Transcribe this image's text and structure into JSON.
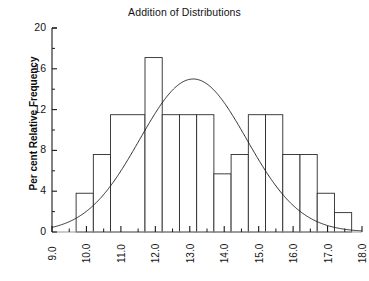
{
  "chart_data": {
    "type": "bar",
    "title": "Addition of Distributions",
    "xlabel": "",
    "ylabel": "Per cent Relative Frequency",
    "xlim": [
      9.0,
      18.0
    ],
    "ylim": [
      0,
      20
    ],
    "grid": false,
    "legend": null,
    "bin_width": 0.5,
    "bin_edges": [
      9.7,
      10.2,
      10.7,
      11.2,
      11.7,
      12.2,
      12.7,
      13.2,
      13.7,
      14.2,
      14.7,
      15.2,
      15.7,
      16.2,
      16.7,
      17.2,
      17.7
    ],
    "categories": [
      "9.7-10.2",
      "10.2-10.7",
      "10.7-11.2",
      "11.2-11.7",
      "11.7-12.2",
      "12.2-12.7",
      "12.7-13.2",
      "13.2-13.7",
      "13.7-14.2",
      "14.2-14.7",
      "14.7-15.2",
      "15.2-15.7",
      "15.7-16.2",
      "16.2-16.7",
      "16.7-17.2",
      "17.2-17.7"
    ],
    "values": [
      3.8,
      7.6,
      11.5,
      17.1,
      11.5,
      11.5,
      11.5,
      11.5,
      5.7,
      5.7,
      7.6,
      11.5,
      7.6,
      7.6,
      3.8,
      1.9
    ],
    "bars": [
      {
        "x0": 9.7,
        "x1": 10.2,
        "height": 3.8
      },
      {
        "x0": 10.2,
        "x1": 10.7,
        "height": 7.6
      },
      {
        "x0": 10.7,
        "x1": 11.7,
        "height": 11.5
      },
      {
        "x0": 11.7,
        "x1": 12.2,
        "height": 17.1
      },
      {
        "x0": 12.2,
        "x1": 12.7,
        "height": 11.5
      },
      {
        "x0": 12.7,
        "x1": 13.2,
        "height": 11.5
      },
      {
        "x0": 13.2,
        "x1": 13.7,
        "height": 11.5
      },
      {
        "x0": 13.7,
        "x1": 14.2,
        "height": 5.7
      },
      {
        "x0": 14.2,
        "x1": 14.7,
        "height": 7.6
      },
      {
        "x0": 14.7,
        "x1": 15.2,
        "height": 11.5
      },
      {
        "x0": 15.2,
        "x1": 15.7,
        "height": 11.5
      },
      {
        "x0": 15.7,
        "x1": 16.2,
        "height": 7.6
      },
      {
        "x0": 16.2,
        "x1": 16.7,
        "height": 7.6
      },
      {
        "x0": 16.7,
        "x1": 17.2,
        "height": 3.8
      },
      {
        "x0": 17.2,
        "x1": 17.7,
        "height": 1.9
      }
    ],
    "overlay_curve": {
      "name": "normal-curve",
      "type": "line",
      "mean": 13.1,
      "peak_value": 15.0,
      "std_dev": 1.55,
      "x_start": 9.0,
      "x_end": 18.0
    },
    "y_ticks_major": [
      0,
      4,
      8,
      12,
      16,
      20
    ],
    "y_ticks_major_labels": [
      "0",
      "4",
      "8",
      "12",
      "16",
      "20"
    ],
    "y_ticks_minor": [
      2,
      6,
      10,
      14,
      18
    ],
    "x_ticks_major": [
      9.0,
      10.0,
      11.0,
      12.0,
      13.0,
      14.0,
      15.0,
      16.0,
      17.0,
      18.0
    ],
    "x_ticks_major_labels": [
      "9.0",
      "10.0",
      "11.0",
      "12.0",
      "13.0",
      "14.0",
      "15.0",
      "16.0",
      "17.0",
      "18.0"
    ],
    "x_ticks_minor": [
      9.5,
      10.5,
      11.5,
      12.5,
      13.5,
      14.5,
      15.5,
      16.5,
      17.5
    ],
    "colors": {
      "axis": "#1a1a1a",
      "bar_outline": "#2b2b2b",
      "bar_fill": "#ffffff",
      "curve": "#1a1a1a",
      "text": "#141414",
      "background": "#ffffff"
    }
  }
}
